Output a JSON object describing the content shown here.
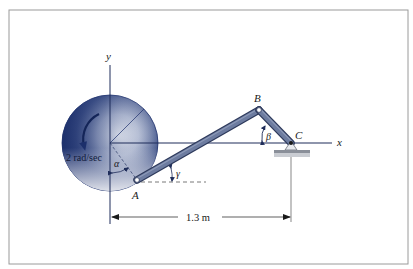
{
  "figure": {
    "frame": {
      "x": 9,
      "y": 10,
      "width": 399,
      "height": 254,
      "stroke": "#9a9a9a"
    },
    "colors": {
      "axis": "#1f2d5a",
      "rod": "#5b6a8e",
      "rod_edge": "#2e3a5c",
      "disk_dark": "#1c2f6b",
      "disk_light": "#f4f6fa",
      "text": "#1a1a1a",
      "support": "#b9bcc2"
    },
    "axes": {
      "x_label": "x",
      "y_label": "y"
    },
    "disk": {
      "center": [
        110,
        143
      ],
      "radius": 48,
      "angular_velocity_label": "2 rad/sec"
    },
    "points": {
      "A": {
        "label": "A",
        "pos": [
          137,
          180
        ]
      },
      "B": {
        "label": "B",
        "pos": [
          259,
          110
        ]
      },
      "C": {
        "label": "C",
        "pos": [
          291,
          143
        ]
      }
    },
    "angles": {
      "alpha": "α",
      "beta": "β",
      "gamma": "γ"
    },
    "dimension": {
      "label": "1.3 m",
      "from_x": 111,
      "to_x": 291,
      "y": 217
    }
  }
}
